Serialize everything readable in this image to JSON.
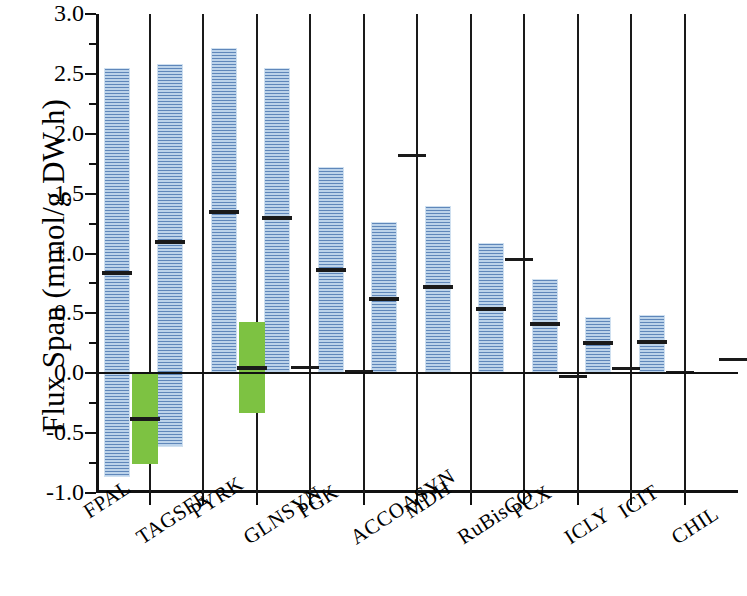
{
  "chart_data": {
    "type": "bar",
    "title": "",
    "xlabel": "",
    "ylabel": "Flux Span (mmol/g DW h)",
    "ylim": [
      -1.0,
      3.0
    ],
    "ytick_labels": [
      "3.0",
      "2.5",
      "2.0",
      "1.5",
      "1.0",
      "0.5",
      "0.0",
      "-0.5",
      "-1.0"
    ],
    "ytick_values": [
      3.0,
      2.5,
      2.0,
      1.5,
      1.0,
      0.5,
      0.0,
      -0.5,
      -1.0
    ],
    "minor_tick_step": 0.25,
    "grid": false,
    "legend": "none",
    "categories": [
      "FPAL",
      "TAGSFE",
      "PYRK",
      "GLNSYN",
      "PGK",
      "ACCOASYN",
      "MDH",
      "RuBisCO",
      "PCX",
      "ICLY",
      "ICIT",
      "CHIL"
    ],
    "colors": {
      "primary_bar": "#9cc0e0",
      "secondary_bar": "#7dc242",
      "median_marker": "#1a1a1a",
      "axis": "#111111"
    },
    "series": [
      {
        "name": "primary-range",
        "color": "#9cc0e0",
        "bars": [
          {
            "category": "FPAL",
            "low": -0.87,
            "high": 2.55,
            "median": 0.84
          },
          {
            "category": "TAGSFE",
            "low": -0.62,
            "high": 2.58,
            "median": 1.1
          },
          {
            "category": "PYRK",
            "low": -0.01,
            "high": 2.72,
            "median": 1.35
          },
          {
            "category": "GLNSYN",
            "low": 0.0,
            "high": 2.55,
            "median": 1.3
          },
          {
            "category": "PGK",
            "low": 0.0,
            "high": 1.72,
            "median": 0.86
          },
          {
            "category": "ACCOASYN",
            "low": 0.0,
            "high": 1.26,
            "median": 0.62
          },
          {
            "category": "MDH",
            "low": 0.0,
            "high": 1.4,
            "median": 0.72
          },
          {
            "category": "RuBisCO",
            "low": 0.0,
            "high": 1.09,
            "median": 0.54
          },
          {
            "category": "PCX",
            "low": 0.0,
            "high": 0.79,
            "median": 0.41
          },
          {
            "category": "ICLY",
            "low": 0.0,
            "high": 0.47,
            "median": 0.25
          },
          {
            "category": "ICIT",
            "low": 0.0,
            "high": 0.49,
            "median": 0.26
          },
          {
            "category": "CHIL",
            "low": 0.0,
            "high": 0.0,
            "median": 0.0
          }
        ]
      },
      {
        "name": "secondary-range",
        "color": "#7dc242",
        "bars": [
          {
            "category": "FPAL",
            "low": -0.76,
            "high": 0.0,
            "median": -0.38
          },
          {
            "category": "PYRK",
            "low": -0.33,
            "high": 0.43,
            "median": 0.04
          }
        ]
      },
      {
        "name": "marker-only",
        "color": "#1a1a1a",
        "markers": [
          {
            "category": "GLNSYN",
            "value": 0.05
          },
          {
            "category": "PGK",
            "value": 0.02
          },
          {
            "category": "ACCOASYN",
            "value": 1.82
          },
          {
            "category": "RuBisCO",
            "value": 0.95
          },
          {
            "category": "PCX",
            "value": -0.02
          },
          {
            "category": "ICLY",
            "value": 0.04
          },
          {
            "category": "ICIT",
            "value": 0.01
          },
          {
            "category": "CHIL",
            "value": 0.12
          }
        ]
      }
    ]
  }
}
